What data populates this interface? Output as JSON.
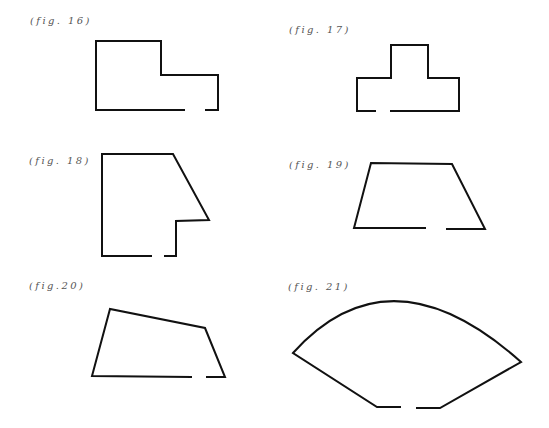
{
  "figures": [
    {
      "label": "(fig. 16)",
      "shape": "L-shaped rectangle with gap in bottom edge"
    },
    {
      "label": "(fig. 17)",
      "shape": "T-shaped outline with gap in bottom edge"
    },
    {
      "label": "(fig. 18)",
      "shape": "pentagon with slanted right side and gap in bottom edge"
    },
    {
      "label": "(fig. 19)",
      "shape": "trapezoid with gap in bottom edge"
    },
    {
      "label": "(fig.20)",
      "shape": "irregular quadrilateral with gap in bottom edge"
    },
    {
      "label": "(fig. 21)",
      "shape": "fan / sector shape with arc top and gap in bottom edge"
    }
  ],
  "colors": {
    "stroke": "#111111",
    "label": "#555555",
    "background": "#ffffff"
  }
}
